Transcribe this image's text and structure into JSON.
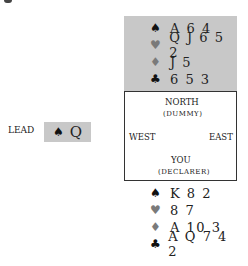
{
  "north": {
    "hand": [
      {
        "suit": "♠",
        "suit_name": "spades",
        "cards": "A 6 4"
      },
      {
        "suit": "♥",
        "suit_name": "hearts",
        "cards": "Q J 6 5 2"
      },
      {
        "suit": "♦",
        "suit_name": "diamonds",
        "cards": "J 5"
      },
      {
        "suit": "♣",
        "suit_name": "clubs",
        "cards": "6 5 3"
      }
    ]
  },
  "compass": {
    "north": "NORTH",
    "north_sub": "(DUMMY)",
    "west": "WEST",
    "east": "EAST",
    "south": "YOU",
    "south_sub": "(DECLARER)"
  },
  "lead": {
    "label": "LEAD",
    "suit": "♠",
    "card": "Q"
  },
  "south": {
    "hand": [
      {
        "suit": "♠",
        "suit_name": "spades",
        "cards": "K 8 2"
      },
      {
        "suit": "♥",
        "suit_name": "hearts",
        "cards": "8 7"
      },
      {
        "suit": "♦",
        "suit_name": "diamonds",
        "cards": "A 10 3"
      },
      {
        "suit": "♣",
        "suit_name": "clubs",
        "cards": "A Q 7 4 2"
      }
    ]
  },
  "colors": {
    "panel_gray": "#c8c8c8",
    "red_suit_gray": "#7a7a7a",
    "black_suit": "#111111"
  }
}
